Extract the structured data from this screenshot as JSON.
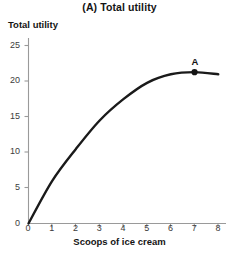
{
  "chart_data": {
    "type": "line",
    "title": "(A) Total utility",
    "xlabel": "Scoops of ice cream",
    "ylabel": "Total utility",
    "xlim": [
      0,
      8.2
    ],
    "ylim": [
      0,
      26
    ],
    "xticks": [
      0,
      1,
      2,
      3,
      4,
      5,
      6,
      7,
      8
    ],
    "yticks": [
      0,
      5,
      10,
      15,
      20,
      25
    ],
    "grid": false,
    "legend": null,
    "x": [
      0,
      1,
      2,
      3,
      4,
      5,
      6,
      7,
      8
    ],
    "values": [
      0,
      6,
      10.5,
      14.5,
      17.5,
      19.8,
      21,
      21.3,
      21
    ],
    "series": [
      {
        "name": "Total utility",
        "color": "#1a1a1a",
        "values": [
          0,
          6,
          10.5,
          14.5,
          17.5,
          19.8,
          21,
          21.3,
          21
        ]
      }
    ],
    "annotations": [
      {
        "label": "A",
        "x": 7,
        "y": 21.3,
        "marker": "dot",
        "color": "#141414"
      }
    ]
  },
  "axes": {
    "axis_color": "#9a9a9a",
    "tick_color": "#9a9a9a",
    "curve_color": "#1a1a1a"
  }
}
